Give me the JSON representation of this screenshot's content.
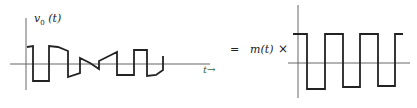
{
  "diagram": {
    "left_plot": {
      "y_label": "v",
      "y_label_sub": "0",
      "y_label_arg": "(t)",
      "x_label": "t→",
      "axis_color": "#555555",
      "trace_color": "#222222"
    },
    "operator_equals": "=",
    "modulating_signal": "m(t)",
    "operator_times": "×",
    "right_plot": {
      "description": "square-wave carrier",
      "axis_color": "#555555",
      "trace_color": "#222222"
    }
  }
}
